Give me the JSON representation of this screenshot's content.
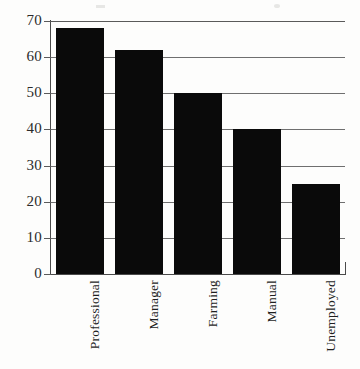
{
  "chart_data": {
    "type": "bar",
    "title": "",
    "subtitle": "",
    "xlabel": "",
    "ylabel": "",
    "categories": [
      "Professional",
      "Manager",
      "Farming",
      "Manual",
      "Unemployed"
    ],
    "values": [
      68,
      62,
      50,
      40,
      25
    ],
    "series": [
      {
        "name": "",
        "values": [
          68,
          62,
          50,
          40,
          25
        ]
      }
    ],
    "ylim": [
      0,
      70
    ],
    "yticks": [
      0,
      10,
      20,
      30,
      40,
      50,
      60,
      70
    ],
    "ytick_labels": [
      "0",
      "10",
      "20",
      "30",
      "40",
      "50",
      "60",
      "70"
    ],
    "grid": true,
    "grid_axis": "y",
    "legend": false,
    "legend_position": "none",
    "bar_color": "#0a0a0a",
    "gridline_color": "#6f6f6f",
    "axis_color": "#4a4a4a",
    "background_color": "#fdfdfc",
    "xtick_rotation": 90
  }
}
